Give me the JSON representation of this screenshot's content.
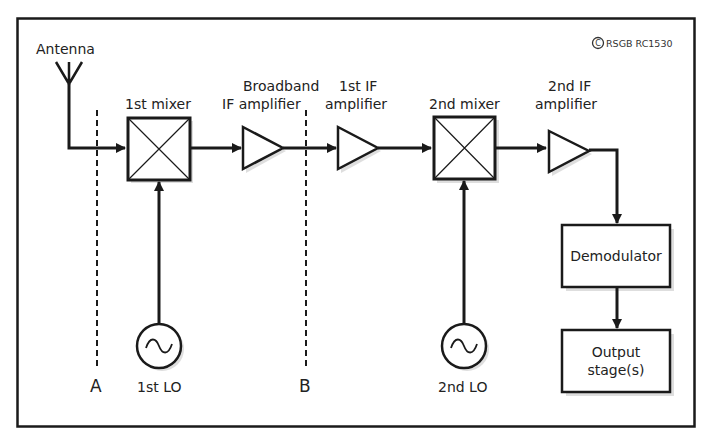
{
  "diagram": {
    "copyright": "RSGB RC1530",
    "copyright_symbol": "©",
    "antenna_label": "Antenna",
    "blocks": {
      "mixer1": {
        "label": "1st mixer"
      },
      "bb_amp": {
        "label_line1": "Broadband",
        "label_line2": "IF amplifier"
      },
      "if1_amp": {
        "label_line1": "1st IF",
        "label_line2": "amplifier"
      },
      "mixer2": {
        "label": "2nd mixer"
      },
      "if2_amp": {
        "label_line1": "2nd IF",
        "label_line2": "amplifier"
      },
      "demod": {
        "label": "Demodulator"
      },
      "output": {
        "label_line1": "Output",
        "label_line2": "stage(s)"
      },
      "lo1": {
        "label": "1st LO"
      },
      "lo2": {
        "label": "2nd LO"
      }
    },
    "reference_planes": [
      {
        "label": "A"
      },
      {
        "label": "B"
      }
    ],
    "colors": {
      "line": "#1a1a1a",
      "shadow": "#bdbdbd",
      "background": "#ffffff"
    }
  }
}
